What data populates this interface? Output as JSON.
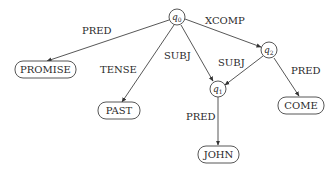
{
  "diagram": {
    "type": "f-structure graph",
    "nodes": {
      "q0": {
        "label": "q",
        "sub": "0"
      },
      "q1": {
        "label": "q",
        "sub": "1"
      },
      "q2": {
        "label": "q",
        "sub": "2"
      },
      "promise": {
        "label": "PROMISE"
      },
      "past": {
        "label": "PAST"
      },
      "come": {
        "label": "COME"
      },
      "john": {
        "label": "JOHN"
      }
    },
    "edges": [
      {
        "from": "q0",
        "to": "promise",
        "label": "PRED"
      },
      {
        "from": "q0",
        "to": "past",
        "label": "TENSE"
      },
      {
        "from": "q0",
        "to": "q1",
        "label": "SUBJ"
      },
      {
        "from": "q0",
        "to": "q2",
        "label": "XCOMP"
      },
      {
        "from": "q2",
        "to": "q1",
        "label": "SUBJ"
      },
      {
        "from": "q2",
        "to": "come",
        "label": "PRED"
      },
      {
        "from": "q1",
        "to": "john",
        "label": "PRED"
      }
    ]
  }
}
